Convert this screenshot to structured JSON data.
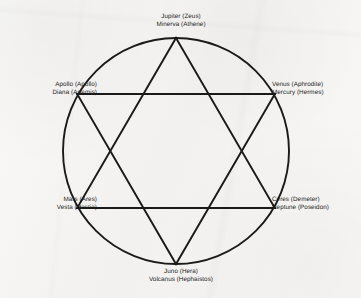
{
  "figure": {
    "shape": "hexagram-in-circle",
    "colors": {
      "background": "#f3f2f0",
      "ink": "#1a1a1a",
      "text": "#1c1c1c"
    },
    "geometry": {
      "center_x": 176,
      "center_y": 151,
      "radius": 113,
      "vertex_count": 6,
      "vertex_angles_deg": [
        270,
        330,
        30,
        90,
        150,
        210
      ]
    }
  },
  "labels": {
    "top": {
      "position": "top",
      "roman": "Jupiter (Zeus)",
      "second": "Minerva (Athene)"
    },
    "upper_right": {
      "position": "upper-right",
      "roman": "Venus (Aphrodite)",
      "second": "Mercury (Hermes)"
    },
    "lower_right": {
      "position": "lower-right",
      "roman": "Ceres (Demeter)",
      "second": "Neptune (Poseidon)"
    },
    "bottom": {
      "position": "bottom",
      "roman": "Juno (Hera)",
      "second": "Volcanus (Hephaistos)"
    },
    "lower_left": {
      "position": "lower-left",
      "roman": "Mars (Ares)",
      "second": "Vesta (Hestia)"
    },
    "upper_left": {
      "position": "upper-left",
      "roman": "Apollo (Apollo)",
      "second": "Diana (Artemis)"
    }
  }
}
